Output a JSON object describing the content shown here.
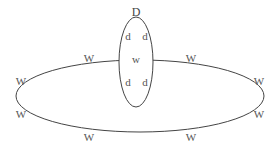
{
  "diagram": {
    "outer_ellipse": {
      "cx": 140,
      "cy": 96,
      "rx": 124,
      "ry": 36,
      "stroke": "#444444"
    },
    "inner_ellipse": {
      "cx": 136,
      "cy": 62,
      "rx": 17,
      "ry": 45,
      "stroke": "#444444"
    },
    "inner_title": {
      "text": "D",
      "x": 136,
      "y": 16
    },
    "inner_labels": [
      {
        "text": "d",
        "x": 128,
        "y": 40
      },
      {
        "text": "d",
        "x": 145,
        "y": 40
      },
      {
        "text": "w",
        "x": 136,
        "y": 63
      },
      {
        "text": "d",
        "x": 128,
        "y": 86
      },
      {
        "text": "d",
        "x": 145,
        "y": 86
      }
    ],
    "outer_labels": [
      {
        "text": "W",
        "x": 89,
        "y": 62
      },
      {
        "text": "W",
        "x": 191,
        "y": 62
      },
      {
        "text": "W",
        "x": 21,
        "y": 85
      },
      {
        "text": "W",
        "x": 259,
        "y": 85
      },
      {
        "text": "W",
        "x": 21,
        "y": 118
      },
      {
        "text": "W",
        "x": 259,
        "y": 118
      },
      {
        "text": "W",
        "x": 89,
        "y": 141
      },
      {
        "text": "W",
        "x": 191,
        "y": 141
      }
    ]
  }
}
